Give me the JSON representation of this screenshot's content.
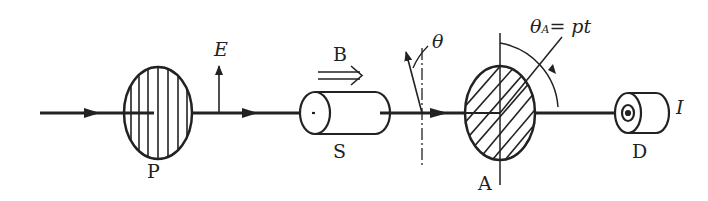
{
  "diagram": {
    "type": "optical setup (Faraday rotation measurement)",
    "colors": {
      "line": "#222222",
      "background": "#ffffff"
    },
    "components": [
      {
        "id": "P",
        "label": "P",
        "kind": "polarizer",
        "hatch": "vertical"
      },
      {
        "id": "S",
        "label": "S",
        "kind": "sample cylinder"
      },
      {
        "id": "A",
        "label": "A",
        "kind": "rotating analyzer",
        "hatch": "diagonal"
      },
      {
        "id": "D",
        "label": "D",
        "kind": "detector"
      }
    ],
    "labels": {
      "P": "P",
      "E": "E",
      "B": "B",
      "S": "S",
      "theta": "θ",
      "A": "A",
      "thetaA_main": "θ",
      "thetaA_sub": "A",
      "thetaA_rhs": "= pt",
      "D": "D",
      "I": "I"
    }
  }
}
